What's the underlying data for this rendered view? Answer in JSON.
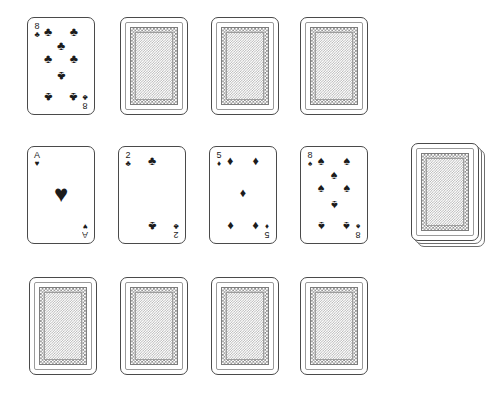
{
  "app": {
    "title": "Solitaire card layout",
    "background_color": "#ffffff",
    "card_ink_color": "#1c1c1c",
    "card_border_color": "#4a4a4a",
    "card_back_pattern_color": "#8d8d8d"
  },
  "glyphs": {
    "spade": "♠",
    "heart": "♥",
    "diamond": "♦",
    "club": "♣"
  },
  "tableau": {
    "rows": [
      {
        "name": "row-top",
        "cards": [
          {
            "facing": "up",
            "rank": "8",
            "suit": "club",
            "suit_name": "clubs",
            "label": "8 of Clubs",
            "pip_count": 8
          },
          {
            "facing": "down",
            "label": "Card back"
          },
          {
            "facing": "down",
            "label": "Card back"
          },
          {
            "facing": "down",
            "label": "Card back"
          }
        ]
      },
      {
        "name": "row-middle",
        "cards": [
          {
            "facing": "up",
            "rank": "A",
            "suit": "heart",
            "suit_name": "hearts",
            "label": "Ace of Hearts",
            "pip_count": 1
          },
          {
            "facing": "up",
            "rank": "2",
            "suit": "club",
            "suit_name": "clubs",
            "label": "2 of Clubs",
            "pip_count": 2
          },
          {
            "facing": "up",
            "rank": "5",
            "suit": "diamond",
            "suit_name": "diamonds",
            "label": "5 of Diamonds",
            "pip_count": 5
          },
          {
            "facing": "up",
            "rank": "8",
            "suit": "spade",
            "suit_name": "spades",
            "label": "8 of Spades",
            "pip_count": 8
          }
        ]
      },
      {
        "name": "row-bottom",
        "cards": [
          {
            "facing": "down",
            "label": "Card back"
          },
          {
            "facing": "down",
            "label": "Card back"
          },
          {
            "facing": "down",
            "label": "Card back"
          },
          {
            "facing": "down",
            "label": "Card back"
          }
        ]
      }
    ]
  },
  "deck": {
    "name": "stock-pile",
    "label": "Stock pile",
    "facing": "down",
    "visible_layers": 3
  }
}
